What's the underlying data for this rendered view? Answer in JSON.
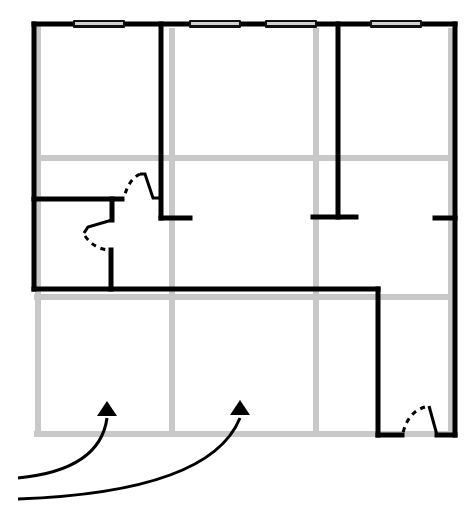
{
  "diagram": {
    "type": "floor-plan",
    "colors": {
      "wall": "#000000",
      "grid": "#c8c8c8",
      "window_glass": "#d2d2d2",
      "background": "#ffffff"
    },
    "grid": {
      "vertical_x": [
        38,
        172,
        316,
        452
      ],
      "horizontal_y": [
        158,
        297,
        434
      ]
    },
    "windows": [
      {
        "x": 73,
        "width": 50
      },
      {
        "x": 190,
        "width": 50
      },
      {
        "x": 266,
        "width": 50
      },
      {
        "x": 371,
        "width": 50
      }
    ],
    "doors": [
      {
        "name": "closet-door-upper"
      },
      {
        "name": "closet-door-lower"
      },
      {
        "name": "bottom-right-door"
      }
    ],
    "arrows": [
      {
        "name": "entry-arrow-left",
        "target": "lower-left-zone"
      },
      {
        "name": "entry-arrow-right",
        "target": "lower-middle-zone"
      }
    ]
  }
}
